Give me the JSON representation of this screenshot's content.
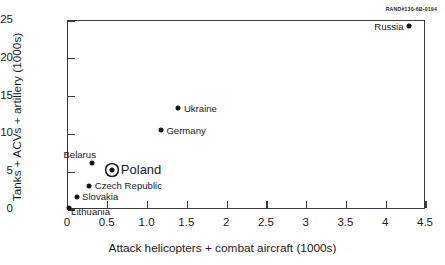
{
  "figure": {
    "source_code": "RAND#130-6B-0194"
  },
  "chart_data": {
    "type": "scatter",
    "title": "",
    "xlabel": "Attack helicopters + combat aircraft (1000s)",
    "ylabel": "Tanks + ACVs + artillery (1000s)",
    "xlim": [
      0,
      4.5
    ],
    "ylim": [
      0,
      25
    ],
    "grid": false,
    "legend": "none",
    "xticks": [
      0,
      0.5,
      1.0,
      1.5,
      2,
      2.5,
      3,
      3.5,
      4,
      4.5
    ],
    "xtick_labels": [
      "0",
      "0.5",
      "1.0",
      "1.5",
      "2",
      "2.5",
      "3",
      "3.5",
      "4",
      "4.5"
    ],
    "yticks": [
      0,
      5,
      10,
      15,
      20,
      25
    ],
    "ytick_labels": [
      "0",
      "5",
      "10",
      "15",
      "20",
      "25"
    ],
    "points": [
      {
        "label": "Russia",
        "x": 4.3,
        "y": 24.2,
        "marker": "dot",
        "label_pos": "left"
      },
      {
        "label": "Ukraine",
        "x": 1.4,
        "y": 13.3,
        "marker": "dot",
        "label_pos": "right"
      },
      {
        "label": "Germany",
        "x": 1.18,
        "y": 10.4,
        "marker": "dot",
        "label_pos": "right"
      },
      {
        "label": "Belarus",
        "x": 0.32,
        "y": 6.1,
        "marker": "dot",
        "label_pos": "above-left"
      },
      {
        "label": "Poland",
        "x": 0.57,
        "y": 5.2,
        "marker": "ringed",
        "label_pos": "right-wide",
        "emphasis": true
      },
      {
        "label": "Czech Republic",
        "x": 0.28,
        "y": 3.1,
        "marker": "dot",
        "label_pos": "right"
      },
      {
        "label": "Slovakia",
        "x": 0.12,
        "y": 1.6,
        "marker": "dot",
        "label_pos": "right"
      },
      {
        "label": "Lithuania",
        "x": 0.02,
        "y": 0.1,
        "marker": "dot",
        "label_pos": "below-left"
      }
    ]
  }
}
